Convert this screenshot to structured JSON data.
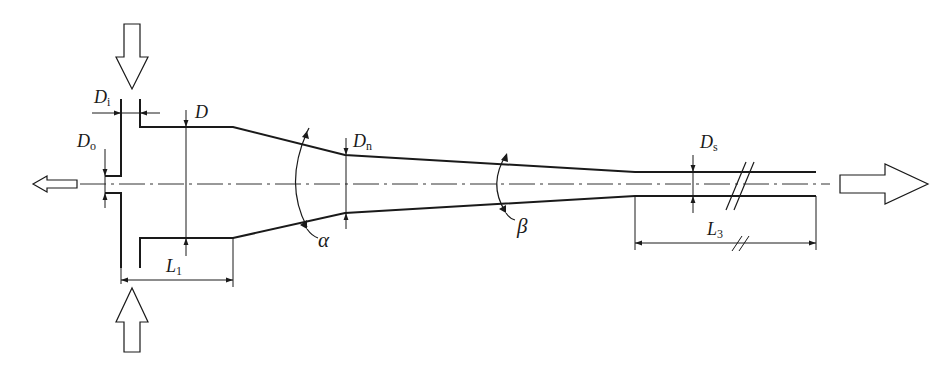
{
  "diagram": {
    "type": "ejector-nozzle-cross-section",
    "colors": {
      "stroke": "#1a1a1a",
      "background": "#ffffff",
      "centerline": "#333333"
    },
    "labels": {
      "D_i": {
        "main": "D",
        "sub": "i"
      },
      "D": {
        "main": "D",
        "sub": ""
      },
      "D_o": {
        "main": "D",
        "sub": "o"
      },
      "D_n": {
        "main": "D",
        "sub": "n"
      },
      "D_s": {
        "main": "D",
        "sub": "s"
      },
      "alpha": {
        "main": "α"
      },
      "beta": {
        "main": "β"
      },
      "L_1": {
        "main": "L",
        "sub": "1"
      },
      "L_3": {
        "main": "L",
        "sub": "3"
      }
    },
    "flow_arrows": [
      {
        "name": "inlet-top",
        "direction": "down"
      },
      {
        "name": "inlet-bottom",
        "direction": "up"
      },
      {
        "name": "outlet-left",
        "direction": "left"
      },
      {
        "name": "outlet-right",
        "direction": "right"
      }
    ]
  }
}
